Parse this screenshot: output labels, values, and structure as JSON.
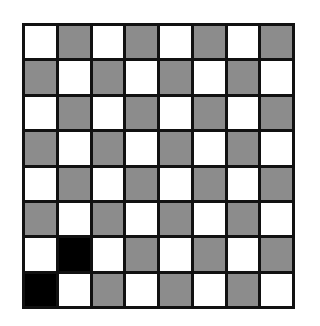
{
  "board": {
    "rows": 8,
    "cols": 8,
    "colors": {
      "W": "#ffffff",
      "G": "#8c8c8c",
      "B": "#000000"
    },
    "cells": [
      [
        "W",
        "G",
        "W",
        "G",
        "W",
        "G",
        "W",
        "G"
      ],
      [
        "G",
        "W",
        "G",
        "W",
        "G",
        "W",
        "G",
        "W"
      ],
      [
        "W",
        "G",
        "W",
        "G",
        "W",
        "G",
        "W",
        "G"
      ],
      [
        "G",
        "W",
        "G",
        "W",
        "G",
        "W",
        "G",
        "W"
      ],
      [
        "W",
        "G",
        "W",
        "G",
        "W",
        "G",
        "W",
        "G"
      ],
      [
        "G",
        "W",
        "G",
        "W",
        "G",
        "W",
        "G",
        "W"
      ],
      [
        "W",
        "B",
        "W",
        "G",
        "W",
        "G",
        "W",
        "G"
      ],
      [
        "B",
        "W",
        "G",
        "W",
        "G",
        "W",
        "G",
        "W"
      ]
    ]
  }
}
